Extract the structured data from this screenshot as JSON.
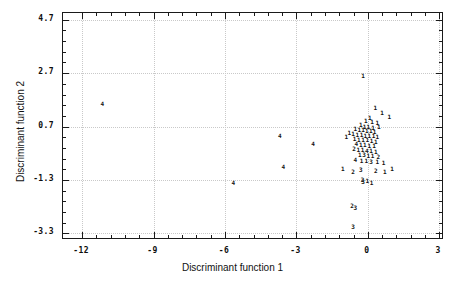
{
  "chart_data": {
    "type": "scatter",
    "title": "",
    "xlabel": "Discriminant function 1",
    "ylabel": "Discriminant function 2",
    "xlim": [
      -12.8,
      3.2
    ],
    "ylim": [
      -3.55,
      4.95
    ],
    "xticks": [
      -12,
      -9,
      -6,
      -3,
      0,
      3
    ],
    "xticklabels": [
      "-12",
      "-9",
      "-6",
      "-3",
      "0",
      "3"
    ],
    "yticks": [
      4.7,
      2.7,
      0.7,
      -1.3,
      -3.3
    ],
    "yticklabels": [
      "4.7",
      "2.7",
      "0.7",
      "-1.3",
      "-3.3"
    ],
    "xtick_minor_step": 0.6,
    "ytick_minor_step": 0.4,
    "grid": true,
    "grid_style": "dotted",
    "legend": "none",
    "marker_style": "group-digit-label",
    "groups": [
      "1",
      "2",
      "3",
      "4"
    ],
    "points": [
      {
        "label": "4",
        "x": -11.15,
        "y": 1.55
      },
      {
        "label": "4",
        "x": -5.65,
        "y": -1.4
      },
      {
        "label": "4",
        "x": -3.7,
        "y": 0.36
      },
      {
        "label": "4",
        "x": -3.55,
        "y": -0.82
      },
      {
        "label": "4",
        "x": -2.3,
        "y": 0.05
      },
      {
        "label": "1",
        "x": -0.2,
        "y": 2.6
      },
      {
        "label": "1",
        "x": 0.32,
        "y": 1.38
      },
      {
        "label": "1",
        "x": 0.08,
        "y": 1.02
      },
      {
        "label": "1",
        "x": -0.08,
        "y": 0.92
      },
      {
        "label": "1",
        "x": 0.18,
        "y": 0.86
      },
      {
        "label": "1",
        "x": 0.4,
        "y": 0.82
      },
      {
        "label": "1",
        "x": -0.3,
        "y": 0.74
      },
      {
        "label": "1",
        "x": -0.14,
        "y": 0.7
      },
      {
        "label": "1",
        "x": 0.02,
        "y": 0.7
      },
      {
        "label": "1",
        "x": 0.22,
        "y": 0.66
      },
      {
        "label": "1",
        "x": 0.46,
        "y": 0.68
      },
      {
        "label": "1",
        "x": -0.52,
        "y": 0.6
      },
      {
        "label": "1",
        "x": -0.36,
        "y": 0.56
      },
      {
        "label": "1",
        "x": -0.2,
        "y": 0.56
      },
      {
        "label": "1",
        "x": -0.04,
        "y": 0.54
      },
      {
        "label": "1",
        "x": 0.12,
        "y": 0.52
      },
      {
        "label": "1",
        "x": 0.28,
        "y": 0.5
      },
      {
        "label": "1",
        "x": -0.62,
        "y": 0.42
      },
      {
        "label": "1",
        "x": -0.44,
        "y": 0.4
      },
      {
        "label": "1",
        "x": -0.26,
        "y": 0.38
      },
      {
        "label": "1",
        "x": -0.1,
        "y": 0.36
      },
      {
        "label": "1",
        "x": 0.06,
        "y": 0.34
      },
      {
        "label": "1",
        "x": 0.24,
        "y": 0.34
      },
      {
        "label": "1",
        "x": 0.4,
        "y": 0.3
      },
      {
        "label": "1",
        "x": -0.56,
        "y": 0.22
      },
      {
        "label": "1",
        "x": -0.38,
        "y": 0.2
      },
      {
        "label": "1",
        "x": -0.2,
        "y": 0.18
      },
      {
        "label": "1",
        "x": -0.02,
        "y": 0.18
      },
      {
        "label": "1",
        "x": 0.16,
        "y": 0.16
      },
      {
        "label": "1",
        "x": 0.34,
        "y": 0.14
      },
      {
        "label": "4",
        "x": -0.48,
        "y": 0.04
      },
      {
        "label": "1",
        "x": -0.3,
        "y": 0.02
      },
      {
        "label": "1",
        "x": -0.12,
        "y": 0.0
      },
      {
        "label": "1",
        "x": 0.06,
        "y": -0.02
      },
      {
        "label": "1",
        "x": 0.26,
        "y": -0.04
      },
      {
        "label": "2",
        "x": -0.58,
        "y": -0.14
      },
      {
        "label": "1",
        "x": -0.4,
        "y": -0.16
      },
      {
        "label": "1",
        "x": -0.22,
        "y": -0.18
      },
      {
        "label": "4",
        "x": -0.04,
        "y": -0.2
      },
      {
        "label": "1",
        "x": 0.14,
        "y": -0.22
      },
      {
        "label": "1",
        "x": 0.34,
        "y": -0.24
      },
      {
        "label": "1",
        "x": -0.34,
        "y": -0.36
      },
      {
        "label": "3",
        "x": -0.16,
        "y": -0.38
      },
      {
        "label": "1",
        "x": 0.02,
        "y": -0.4
      },
      {
        "label": "1",
        "x": 0.2,
        "y": -0.42
      },
      {
        "label": "2",
        "x": 0.44,
        "y": -0.44
      },
      {
        "label": "4",
        "x": -0.52,
        "y": -0.54
      },
      {
        "label": "1",
        "x": -0.26,
        "y": -0.58
      },
      {
        "label": "1",
        "x": -0.06,
        "y": -0.6
      },
      {
        "label": "3",
        "x": 0.14,
        "y": -0.62
      },
      {
        "label": "1",
        "x": 0.4,
        "y": -0.64
      },
      {
        "label": "1",
        "x": 0.66,
        "y": -0.66
      },
      {
        "label": "1",
        "x": -1.05,
        "y": -0.9
      },
      {
        "label": "2",
        "x": -0.62,
        "y": -1.0
      },
      {
        "label": "3",
        "x": -0.3,
        "y": -0.94
      },
      {
        "label": "2",
        "x": 0.34,
        "y": -0.98
      },
      {
        "label": "1",
        "x": 0.72,
        "y": -1.0
      },
      {
        "label": "1",
        "x": 1.02,
        "y": -0.88
      },
      {
        "label": "1",
        "x": 0.6,
        "y": 1.22
      },
      {
        "label": "1",
        "x": 0.9,
        "y": 1.05
      },
      {
        "label": "1",
        "x": -0.78,
        "y": 0.46
      },
      {
        "label": "1",
        "x": -0.9,
        "y": 0.3
      },
      {
        "label": "2",
        "x": -0.22,
        "y": -1.3
      },
      {
        "label": "3",
        "x": -0.2,
        "y": -1.36
      },
      {
        "label": "1",
        "x": -0.02,
        "y": -1.34
      },
      {
        "label": "1",
        "x": 0.16,
        "y": -1.4
      },
      {
        "label": "2",
        "x": -0.66,
        "y": -2.28
      },
      {
        "label": "3",
        "x": -0.52,
        "y": -2.34
      },
      {
        "label": "3",
        "x": -0.62,
        "y": -3.08
      }
    ]
  }
}
